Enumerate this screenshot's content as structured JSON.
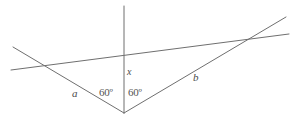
{
  "figure": {
    "background_color": "#ffffff",
    "stroke_color": "#6f6f6f",
    "stroke_width": 1,
    "width": 296,
    "height": 119,
    "vertex": {
      "x": 124,
      "y": 113
    },
    "lines": [
      {
        "name": "vertical-ray-x",
        "description": "vertical ray rising from vertex",
        "x1": 124,
        "y1": 113,
        "x2": 124,
        "y2": 6
      },
      {
        "name": "ray-a",
        "description": "left ray from vertex through left crossing point",
        "x1": 124,
        "y1": 113,
        "x2": 13,
        "y2": 47
      },
      {
        "name": "ray-b",
        "description": "right ray from vertex through right crossing point",
        "x1": 124,
        "y1": 113,
        "x2": 286,
        "y2": 17
      },
      {
        "name": "transversal",
        "description": "shallow line crossing ray a, the vertical ray and ray b",
        "x1": 11,
        "y1": 70,
        "x2": 289,
        "y2": 34
      }
    ],
    "labels": [
      {
        "name": "label-a",
        "text": "a",
        "x": 72,
        "y": 88,
        "style": "seg"
      },
      {
        "name": "label-b",
        "text": "b",
        "x": 193,
        "y": 72,
        "style": "seg"
      },
      {
        "name": "label-x",
        "text": "x",
        "x": 127,
        "y": 67,
        "style": "var-x"
      },
      {
        "name": "label-angle-left",
        "text": "60º",
        "x": 99,
        "y": 87,
        "style": "angle"
      },
      {
        "name": "label-angle-right",
        "text": "60º",
        "x": 128,
        "y": 87,
        "style": "angle"
      }
    ]
  }
}
